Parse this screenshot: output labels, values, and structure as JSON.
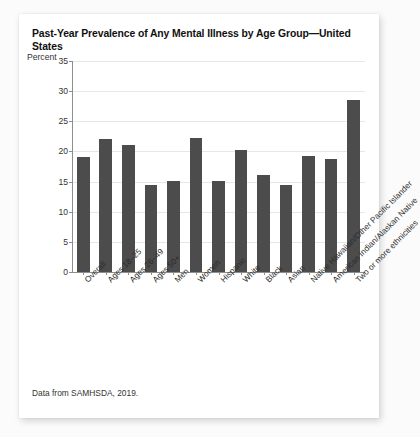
{
  "card": {
    "title": "Past-Year Prevalence of Any Mental Illness by Age Group—United States",
    "source_note": "Data from SAMHSDA, 2019.",
    "background_color": "#ffffff",
    "page_background_color": "#fbfbfb"
  },
  "chart_data": {
    "type": "bar",
    "title": "Past-Year Prevalence of Any Mental Illness by Age Group—United States",
    "xlabel": "",
    "ylabel": "Percent",
    "ylim": [
      0,
      35
    ],
    "yticks": [
      0,
      5,
      10,
      15,
      20,
      25,
      30,
      35
    ],
    "ytick_labels": [
      "0",
      "5",
      "10",
      "15",
      "20",
      "25",
      "30",
      "35"
    ],
    "grid": true,
    "grid_axis": "y",
    "legend": false,
    "bar_color": "#4c4c4c",
    "gridline_color": "#e7e7e7",
    "axis_color": "#8e8e8e",
    "xtick_label_rotation": -45,
    "categories": [
      "Overall",
      "Ages 18–25",
      "Ages 26–49",
      "Ages 50+",
      "Men",
      "Women",
      "Hispanic",
      "White",
      "Black",
      "Asian",
      "Native Hawaiian/Other Pacific Islander",
      "American Indian/Alaskan Native",
      "Two or more ethnicities"
    ],
    "values": [
      19.0,
      22.1,
      21.0,
      14.5,
      15.1,
      22.3,
      15.1,
      20.3,
      16.1,
      14.4,
      19.3,
      18.7,
      28.5
    ]
  }
}
